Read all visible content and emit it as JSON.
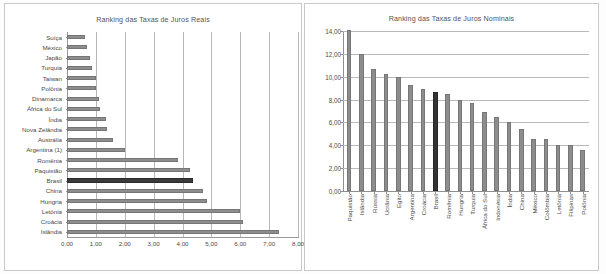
{
  "chart_data": [
    {
      "type": "bar",
      "orientation": "horizontal",
      "title": "Ranking das Taxas de Juros Reais",
      "xlabel": "",
      "ylabel": "",
      "xlim": [
        0,
        8
      ],
      "xticks": [
        "0,00",
        "1,00",
        "2,00",
        "3,00",
        "4,00",
        "5,00",
        "6,00",
        "7,00",
        "8,00"
      ],
      "grid": true,
      "legend": "none",
      "highlight_category": "Brasil",
      "bar_color": "#8d8d8d",
      "highlight_color": "#3a3a3a",
      "categories": [
        "Suíça",
        "México",
        "Japão",
        "Turquia",
        "Taiwan",
        "Polônia",
        "Dinamarca",
        "África do Sul",
        "Índia",
        "Nova Zelândia",
        "Austrália",
        "Argentina (1)",
        "Romênia",
        "Paquistão",
        "Brasil",
        "China",
        "Hungria",
        "Letônia",
        "Croácia",
        "Islândia"
      ],
      "values": [
        0.62,
        0.7,
        0.8,
        0.85,
        1.0,
        1.0,
        1.1,
        1.15,
        1.35,
        1.37,
        1.58,
        2.0,
        3.85,
        4.25,
        4.38,
        4.72,
        4.85,
        5.98,
        6.1,
        7.35
      ]
    },
    {
      "type": "bar",
      "orientation": "vertical",
      "title": "Ranking das Taxas de Juros Nominais",
      "xlabel": "",
      "ylabel": "",
      "ylim": [
        0,
        14
      ],
      "yticks": [
        "0,00",
        "2,00",
        "4,00",
        "6,00",
        "8,00",
        "10,00",
        "12,00",
        "14,00"
      ],
      "grid": true,
      "legend": "none",
      "highlight_category": "Brasil",
      "bar_color": "#8d8d8d",
      "highlight_color": "#333333",
      "categories": [
        "Paquistão",
        "Islândia",
        "Rússia",
        "Ucrânia",
        "Egito",
        "Argentina",
        "Croácia",
        "Brasil",
        "Romênia",
        "Hungria",
        "Turquia",
        "África do Sul",
        "Indonésia",
        "Índia",
        "China",
        "México",
        "Colômbia",
        "Letônia",
        "Filipinas",
        "Polônia"
      ],
      "values": [
        14.05,
        11.95,
        10.7,
        10.2,
        10.0,
        9.3,
        8.95,
        8.7,
        8.45,
        8.0,
        7.7,
        6.95,
        6.5,
        6.05,
        5.4,
        4.55,
        4.55,
        4.0,
        4.05,
        3.55
      ]
    }
  ]
}
